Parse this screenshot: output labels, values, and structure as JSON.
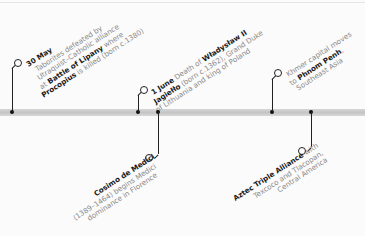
{
  "timeline": {
    "events": [
      {
        "id": "lipany",
        "position": "above",
        "lines": [
          [
            "30 May",
            ""
          ],
          [
            "",
            "Taborites defeated by"
          ],
          [
            "",
            "Utraquist–Catholic alliance"
          ],
          [
            "at ",
            "Battle of Lipany",
            " where"
          ],
          [
            "Procopius",
            " is killed (born c.1380)"
          ]
        ],
        "text": {
          "date": "30 May",
          "l1": "Taborites defeated by",
          "l2": "Utraquist–Catholic alliance",
          "l3a": "at ",
          "l3b": "Battle of Lipany",
          "l3c": " where",
          "l4a": "Procopius",
          "l4b": " is killed (born c.1380)"
        }
      },
      {
        "id": "jagiello",
        "position": "above",
        "text": {
          "date": "1 June",
          "l1a": " Death of ",
          "l1b": "Władysław II",
          "l2a": "Jagiełło",
          "l2b": " (born c.1362), Grand Duke",
          "l3": "of Lithuania and king of Poland"
        }
      },
      {
        "id": "medici",
        "position": "below",
        "text": {
          "title": "Cosimo de Medici",
          "l1": "(1389–1464) begins Medici",
          "l2": "dominance in Florence"
        }
      },
      {
        "id": "khmer",
        "position": "above",
        "text": {
          "l1": "Khmer capital moves",
          "l2a": "to ",
          "l2b": "Phnom Penh",
          "l2c": ",",
          "l3": "Southeast Asia"
        }
      },
      {
        "id": "aztec",
        "position": "below",
        "text": {
          "title": "Aztec Triple Alliance",
          "title_suffix": " with",
          "l1": "Texcoco and Tlacopan,",
          "l2": "Central America"
        }
      }
    ]
  },
  "colors": {
    "bar": "#cccccc",
    "marker": "#111111",
    "label_bold": "#1a1a1a",
    "label": "#8a8a8a"
  }
}
